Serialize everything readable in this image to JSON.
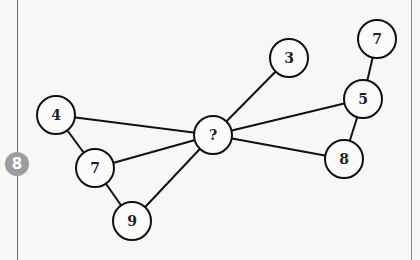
{
  "badge": {
    "label": "8",
    "color": "#9d9d9d"
  },
  "graph": {
    "node_radius": 19,
    "nodes": [
      {
        "id": "center",
        "label": "?",
        "x": 213,
        "y": 135
      },
      {
        "id": "n3",
        "label": "3",
        "x": 289,
        "y": 58
      },
      {
        "id": "n7top",
        "label": "7",
        "x": 377,
        "y": 39
      },
      {
        "id": "n5",
        "label": "5",
        "x": 363,
        "y": 99
      },
      {
        "id": "n8",
        "label": "8",
        "x": 344,
        "y": 159
      },
      {
        "id": "n4",
        "label": "4",
        "x": 56,
        "y": 115
      },
      {
        "id": "n7left",
        "label": "7",
        "x": 95,
        "y": 168
      },
      {
        "id": "n9",
        "label": "9",
        "x": 132,
        "y": 221
      }
    ],
    "edges": [
      [
        "center",
        "n3"
      ],
      [
        "center",
        "n5"
      ],
      [
        "center",
        "n8"
      ],
      [
        "center",
        "n4"
      ],
      [
        "center",
        "n7left"
      ],
      [
        "center",
        "n9"
      ],
      [
        "n7top",
        "n5"
      ],
      [
        "n5",
        "n8"
      ],
      [
        "n4",
        "n7left"
      ],
      [
        "n7left",
        "n9"
      ]
    ]
  }
}
